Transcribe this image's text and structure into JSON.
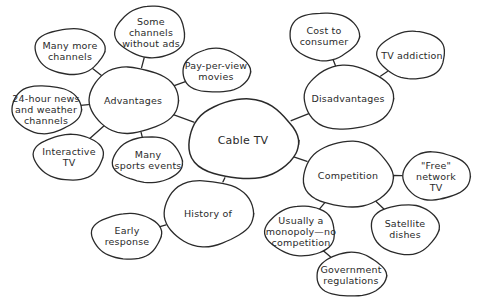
{
  "diagram": {
    "type": "mind-map",
    "stroke_color": "#2a2a2a",
    "fill_color": "#ffffff",
    "nodes": [
      {
        "id": "cable",
        "label": "Cable TV",
        "cx": 243,
        "cy": 140,
        "rx": 55,
        "ry": 40,
        "main": true
      },
      {
        "id": "adv",
        "label": "Advantages",
        "cx": 133,
        "cy": 100,
        "rx": 45,
        "ry": 33
      },
      {
        "id": "more",
        "label": "Many more\nchannels",
        "cx": 70,
        "cy": 51,
        "rx": 35,
        "ry": 23
      },
      {
        "id": "noads",
        "label": "Some\nchannels\nwithout ads",
        "cx": 151,
        "cy": 32,
        "rx": 35,
        "ry": 26
      },
      {
        "id": "ppv",
        "label": "Pay-per-view\nmovies",
        "cx": 216,
        "cy": 71,
        "rx": 34,
        "ry": 22
      },
      {
        "id": "news",
        "label": "24-hour news\nand weather\nchannels",
        "cx": 46,
        "cy": 109,
        "rx": 35,
        "ry": 24
      },
      {
        "id": "interactive",
        "label": "Interactive\nTV",
        "cx": 69,
        "cy": 157,
        "rx": 35,
        "ry": 23
      },
      {
        "id": "sports",
        "label": "Many\nsports events",
        "cx": 148,
        "cy": 160,
        "rx": 35,
        "ry": 23
      },
      {
        "id": "disadv",
        "label": "Disadvantages",
        "cx": 348,
        "cy": 98,
        "rx": 45,
        "ry": 32
      },
      {
        "id": "cost",
        "label": "Cost to\nconsumer",
        "cx": 324,
        "cy": 36,
        "rx": 35,
        "ry": 24
      },
      {
        "id": "addiction",
        "label": "TV addiction",
        "cx": 412,
        "cy": 55,
        "rx": 34,
        "ry": 24
      },
      {
        "id": "comp",
        "label": "Competition",
        "cx": 348,
        "cy": 175,
        "rx": 45,
        "ry": 33
      },
      {
        "id": "free",
        "label": "\"Free\"\nnetwork TV",
        "cx": 436,
        "cy": 176,
        "rx": 34,
        "ry": 24
      },
      {
        "id": "satellite",
        "label": "Satellite\ndishes",
        "cx": 405,
        "cy": 229,
        "rx": 34,
        "ry": 25
      },
      {
        "id": "monopoly",
        "label": "Usually a\nmonopoly—no\ncompetition",
        "cx": 301,
        "cy": 231,
        "rx": 35,
        "ry": 25
      },
      {
        "id": "gov",
        "label": "Government\nregulations",
        "cx": 351,
        "cy": 275,
        "rx": 35,
        "ry": 22
      },
      {
        "id": "history",
        "label": "History of",
        "cx": 208,
        "cy": 213,
        "rx": 45,
        "ry": 33
      },
      {
        "id": "early",
        "label": "Early\nresponse",
        "cx": 127,
        "cy": 236,
        "rx": 35,
        "ry": 23
      }
    ],
    "edges": [
      [
        "cable",
        "adv"
      ],
      [
        "cable",
        "disadv"
      ],
      [
        "cable",
        "comp"
      ],
      [
        "cable",
        "history"
      ],
      [
        "adv",
        "more"
      ],
      [
        "adv",
        "noads"
      ],
      [
        "adv",
        "ppv"
      ],
      [
        "adv",
        "news"
      ],
      [
        "adv",
        "interactive"
      ],
      [
        "adv",
        "sports"
      ],
      [
        "disadv",
        "cost"
      ],
      [
        "disadv",
        "addiction"
      ],
      [
        "comp",
        "free"
      ],
      [
        "comp",
        "satellite"
      ],
      [
        "comp",
        "monopoly"
      ],
      [
        "monopoly",
        "gov"
      ],
      [
        "history",
        "early"
      ]
    ]
  }
}
